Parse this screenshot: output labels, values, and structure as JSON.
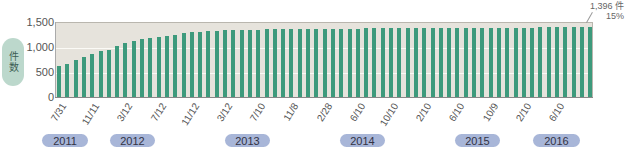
{
  "chart_data": {
    "type": "bar",
    "title": "",
    "ylabel": "件数",
    "xlabel": "",
    "ylim": [
      0,
      1500
    ],
    "yticks": [
      "0",
      "500",
      "1,000",
      "1,500"
    ],
    "grid": true,
    "x_tick_labels": [
      "7/31",
      "11/11",
      "3/12",
      "7/12",
      "11/12",
      "3/12",
      "7/10",
      "11/8",
      "2/28",
      "6/10",
      "10/10",
      "2/10",
      "6/10",
      "10/9",
      "2/10",
      "6/10"
    ],
    "year_labels": [
      "2011",
      "2012",
      "2013",
      "2014",
      "2015",
      "2016"
    ],
    "annotation": {
      "value": "1,396 件",
      "percent": "15%"
    },
    "values": [
      620,
      660,
      740,
      800,
      860,
      920,
      940,
      1020,
      1080,
      1120,
      1160,
      1190,
      1210,
      1230,
      1250,
      1280,
      1300,
      1310,
      1320,
      1330,
      1335,
      1340,
      1345,
      1350,
      1350,
      1355,
      1355,
      1360,
      1360,
      1360,
      1362,
      1365,
      1365,
      1366,
      1368,
      1370,
      1370,
      1372,
      1372,
      1374,
      1375,
      1376,
      1376,
      1378,
      1378,
      1380,
      1380,
      1382,
      1382,
      1383,
      1384,
      1385,
      1386,
      1387,
      1388,
      1388,
      1389,
      1390,
      1391,
      1392,
      1393,
      1394,
      1395,
      1396,
      1396
    ],
    "colors": {
      "bar": "#3d9a7c",
      "plot_bg": "#e6e3dc",
      "year_pill": "#a8b6d8",
      "ylabel_pill": "#bcd8cc"
    }
  }
}
